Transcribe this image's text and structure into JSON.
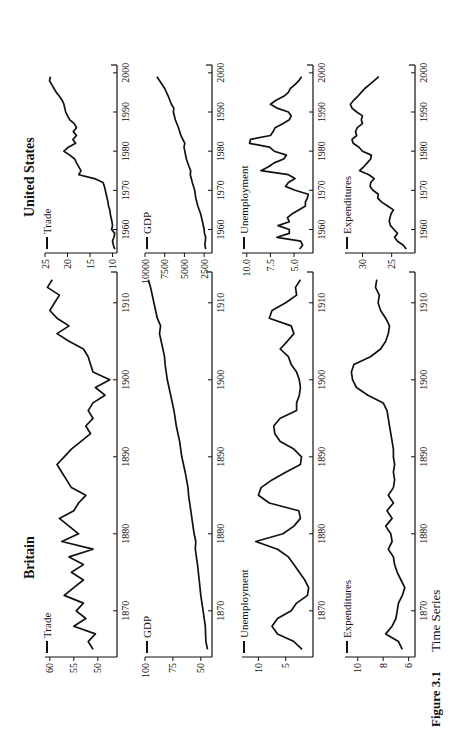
{
  "figure": {
    "number_label": "Figure 3.1",
    "title": "Time Series",
    "columns": [
      {
        "title": "Britain"
      },
      {
        "title": "United States"
      }
    ]
  },
  "chart_data": [
    {
      "type": "line",
      "country": "Britain",
      "title": "Trade",
      "legend": "Trade",
      "xlim": [
        1864,
        1914
      ],
      "ylim": [
        46,
        61
      ],
      "xticks": [
        1870,
        1880,
        1890,
        1900,
        1910
      ],
      "yticks": [
        50,
        55,
        60
      ],
      "x": [
        1865,
        1866,
        1867,
        1868,
        1869,
        1870,
        1871,
        1872,
        1873,
        1874,
        1875,
        1876,
        1877,
        1878,
        1879,
        1880,
        1881,
        1882,
        1883,
        1884,
        1885,
        1886,
        1887,
        1888,
        1889,
        1890,
        1891,
        1892,
        1893,
        1894,
        1895,
        1896,
        1897,
        1898,
        1899,
        1900,
        1901,
        1902,
        1903,
        1904,
        1905,
        1906,
        1907,
        1908,
        1909,
        1910,
        1911,
        1912,
        1913
      ],
      "y": [
        51,
        52,
        50.5,
        55,
        52.5,
        54.5,
        53,
        57,
        55,
        53,
        55.5,
        53,
        56,
        51,
        57.5,
        54,
        56,
        58,
        55,
        54,
        52.5,
        55.5,
        56.5,
        57.5,
        58.5,
        57,
        55.5,
        53.5,
        51.5,
        52.5,
        51,
        52,
        51,
        48.5,
        50.5,
        47.5,
        51,
        51.5,
        52,
        53,
        56,
        58.5,
        56,
        58.5,
        60,
        59,
        58,
        60.5,
        59.5
      ]
    },
    {
      "type": "line",
      "country": "United States",
      "title": "Trade",
      "legend": "Trade",
      "xlim": [
        1954,
        2002
      ],
      "ylim": [
        9,
        25
      ],
      "xticks": [
        1960,
        1970,
        1980,
        1990,
        2000
      ],
      "yticks": [
        10,
        15,
        20,
        25
      ],
      "x": [
        1955,
        1956,
        1957,
        1958,
        1959,
        1960,
        1961,
        1962,
        1963,
        1964,
        1965,
        1966,
        1967,
        1968,
        1969,
        1970,
        1971,
        1972,
        1973,
        1974,
        1975,
        1976,
        1977,
        1978,
        1979,
        1980,
        1981,
        1982,
        1983,
        1984,
        1985,
        1986,
        1987,
        1988,
        1989,
        1990,
        1991,
        1992,
        1993,
        1994,
        1995,
        1996,
        1997,
        1998,
        1999
      ],
      "y": [
        9.5,
        9.8,
        10,
        9.7,
        9.5,
        10.2,
        10,
        10.1,
        10.3,
        10.5,
        10.6,
        10.9,
        11,
        11.2,
        11.4,
        11.6,
        11.8,
        12.1,
        14,
        17.5,
        17,
        17.5,
        18,
        18.4,
        19.5,
        20.8,
        19.8,
        18.2,
        18.8,
        18,
        18.7,
        18,
        18.5,
        19.5,
        20,
        20.4,
        20.6,
        20.8,
        21.2,
        21.8,
        22.5,
        23,
        23.5,
        24,
        23.8
      ]
    },
    {
      "type": "line",
      "country": "Britain",
      "title": "GDP",
      "legend": "GDP",
      "xlim": [
        1864,
        1914
      ],
      "ylim": [
        40,
        100
      ],
      "xticks": [
        1870,
        1880,
        1890,
        1900,
        1910
      ],
      "yticks": [
        50,
        75,
        100
      ],
      "x": [
        1865,
        1866,
        1868,
        1870,
        1872,
        1874,
        1876,
        1878,
        1879,
        1880,
        1882,
        1884,
        1885,
        1886,
        1888,
        1890,
        1892,
        1894,
        1896,
        1898,
        1900,
        1902,
        1903,
        1904,
        1906,
        1907,
        1908,
        1910,
        1912,
        1913
      ],
      "y": [
        44,
        45.5,
        46,
        48,
        50,
        51.5,
        53,
        55,
        54.5,
        56,
        58,
        60,
        61,
        61.5,
        64,
        67,
        69,
        72,
        74,
        77,
        80,
        82,
        82.5,
        84,
        87,
        86,
        89,
        92,
        95,
        97
      ]
    },
    {
      "type": "line",
      "country": "United States",
      "title": "GDP",
      "legend": "GDP",
      "xlim": [
        1954,
        2002
      ],
      "ylim": [
        1500,
        10000
      ],
      "xticks": [
        1960,
        1970,
        1980,
        1990,
        2000
      ],
      "yticks": [
        2500,
        5000,
        7500,
        10000
      ],
      "x": [
        1955,
        1956,
        1957,
        1958,
        1959,
        1960,
        1962,
        1964,
        1966,
        1968,
        1970,
        1972,
        1974,
        1975,
        1976,
        1978,
        1980,
        1981,
        1982,
        1984,
        1986,
        1988,
        1990,
        1991,
        1992,
        1994,
        1996,
        1998,
        1999
      ],
      "y": [
        2300,
        2400,
        2350,
        2300,
        2450,
        2500,
        2700,
        2950,
        3300,
        3550,
        3700,
        4000,
        4250,
        4200,
        4400,
        4750,
        4950,
        5050,
        4950,
        5450,
        5750,
        6150,
        6400,
        6350,
        6650,
        7050,
        7500,
        8150,
        8500
      ]
    },
    {
      "type": "line",
      "country": "Britain",
      "title": "Unemployment",
      "legend": "Unemployment",
      "xlim": [
        1864,
        1914
      ],
      "ylim": [
        0,
        13
      ],
      "xticks": [
        1870,
        1880,
        1890,
        1900,
        1910
      ],
      "yticks": [
        5,
        10
      ],
      "x": [
        1865,
        1866,
        1867,
        1868,
        1869,
        1870,
        1871,
        1872,
        1873,
        1874,
        1875,
        1876,
        1877,
        1878,
        1879,
        1880,
        1881,
        1882,
        1883,
        1884,
        1885,
        1886,
        1887,
        1888,
        1889,
        1890,
        1891,
        1892,
        1893,
        1894,
        1895,
        1896,
        1897,
        1898,
        1899,
        1900,
        1901,
        1902,
        1903,
        1904,
        1905,
        1906,
        1907,
        1908,
        1909,
        1910,
        1911,
        1912,
        1913
      ],
      "y": [
        2,
        3.5,
        6.5,
        7.5,
        6.5,
        4,
        3,
        1,
        0.8,
        1.5,
        2.5,
        3.5,
        4.5,
        6.5,
        10.5,
        5.5,
        3.5,
        2.3,
        2.6,
        8,
        10,
        9.5,
        7.5,
        5,
        2.3,
        2.1,
        3.5,
        6,
        7,
        7.2,
        6,
        3,
        3,
        2.5,
        2.3,
        2.5,
        3,
        4,
        4.5,
        6,
        4.7,
        3.5,
        4,
        8,
        7.5,
        5,
        3,
        3.2,
        2.3
      ]
    },
    {
      "type": "line",
      "country": "United States",
      "title": "Unemployment",
      "legend": "Unemployment",
      "xlim": [
        1954,
        2002
      ],
      "ylim": [
        3,
        10.5
      ],
      "xticks": [
        1960,
        1970,
        1980,
        1990,
        2000
      ],
      "yticks": [
        5.0,
        7.5,
        10.0
      ],
      "x": [
        1955,
        1956,
        1957,
        1958,
        1959,
        1960,
        1961,
        1962,
        1963,
        1964,
        1965,
        1966,
        1967,
        1968,
        1969,
        1970,
        1971,
        1972,
        1973,
        1974,
        1975,
        1976,
        1977,
        1978,
        1979,
        1980,
        1981,
        1982,
        1983,
        1984,
        1985,
        1986,
        1987,
        1988,
        1989,
        1990,
        1991,
        1992,
        1993,
        1994,
        1995,
        1996,
        1997,
        1998,
        1999
      ],
      "y": [
        4.4,
        4.1,
        4.3,
        6.8,
        5.5,
        5.5,
        6.7,
        5.5,
        5.7,
        5.2,
        4.5,
        3.8,
        3.8,
        3.6,
        3.5,
        4.9,
        5.9,
        5.6,
        4.9,
        5.6,
        8.5,
        7.7,
        7.1,
        6.1,
        5.8,
        7.1,
        7.6,
        9.7,
        9.6,
        7.5,
        7.2,
        7,
        6.2,
        5.5,
        5.3,
        5.6,
        6.8,
        7.5,
        6.9,
        6.1,
        5.6,
        5.4,
        4.9,
        4.5,
        4.2
      ]
    },
    {
      "type": "line",
      "country": "Britain",
      "title": "Expenditures",
      "legend": "Expenditures",
      "xlim": [
        1864,
        1914
      ],
      "ylim": [
        5.5,
        11
      ],
      "xticks": [
        1870,
        1880,
        1890,
        1900,
        1910
      ],
      "yticks": [
        6,
        8,
        10
      ],
      "x": [
        1865,
        1866,
        1867,
        1868,
        1869,
        1870,
        1871,
        1872,
        1873,
        1874,
        1875,
        1876,
        1877,
        1878,
        1879,
        1880,
        1881,
        1882,
        1883,
        1884,
        1885,
        1886,
        1887,
        1888,
        1889,
        1890,
        1891,
        1892,
        1893,
        1894,
        1895,
        1896,
        1897,
        1898,
        1899,
        1900,
        1901,
        1902,
        1903,
        1904,
        1905,
        1906,
        1907,
        1908,
        1909,
        1910,
        1911,
        1912,
        1913
      ],
      "y": [
        6.5,
        6.8,
        7.8,
        7.3,
        7,
        6.9,
        6.8,
        6.5,
        6.3,
        6.6,
        6.9,
        7.1,
        7.2,
        7.6,
        7.3,
        7.4,
        7.8,
        7.3,
        7.7,
        7.2,
        7.6,
        7.2,
        7.1,
        7.2,
        7.1,
        7.2,
        7.2,
        7.3,
        7.4,
        7.5,
        7.6,
        7.7,
        8,
        9.2,
        10.1,
        10.4,
        10.5,
        10.3,
        9,
        8.2,
        7.8,
        7.6,
        7.5,
        7.8,
        8.2,
        8.4,
        8.3,
        8.6,
        8.5
      ]
    },
    {
      "type": "line",
      "country": "United States",
      "title": "Expenditures",
      "legend": "Expenditures",
      "xlim": [
        1954,
        2002
      ],
      "ylim": [
        21,
        33
      ],
      "xticks": [
        1960,
        1970,
        1980,
        1990,
        2000
      ],
      "yticks": [
        25,
        30
      ],
      "x": [
        1955,
        1956,
        1957,
        1958,
        1959,
        1960,
        1961,
        1962,
        1963,
        1964,
        1965,
        1966,
        1967,
        1968,
        1969,
        1970,
        1971,
        1972,
        1973,
        1974,
        1975,
        1976,
        1977,
        1978,
        1979,
        1980,
        1981,
        1982,
        1983,
        1984,
        1985,
        1986,
        1987,
        1988,
        1989,
        1990,
        1991,
        1992,
        1993,
        1994,
        1995,
        1996,
        1997,
        1998,
        1999
      ],
      "y": [
        22.5,
        23,
        24,
        24.5,
        24,
        24.6,
        25.2,
        25.4,
        25.3,
        25.1,
        24.7,
        25.7,
        26.7,
        27.4,
        27.3,
        28.2,
        28.7,
        28.6,
        28,
        28.9,
        30.5,
        29.8,
        29.2,
        28.6,
        28.5,
        30,
        30.6,
        31.6,
        31.8,
        31,
        31.2,
        30.9,
        30,
        30.2,
        30,
        31,
        31.8,
        32.1,
        31.5,
        30.8,
        30.2,
        29.6,
        28.8,
        28,
        27.2
      ]
    }
  ]
}
